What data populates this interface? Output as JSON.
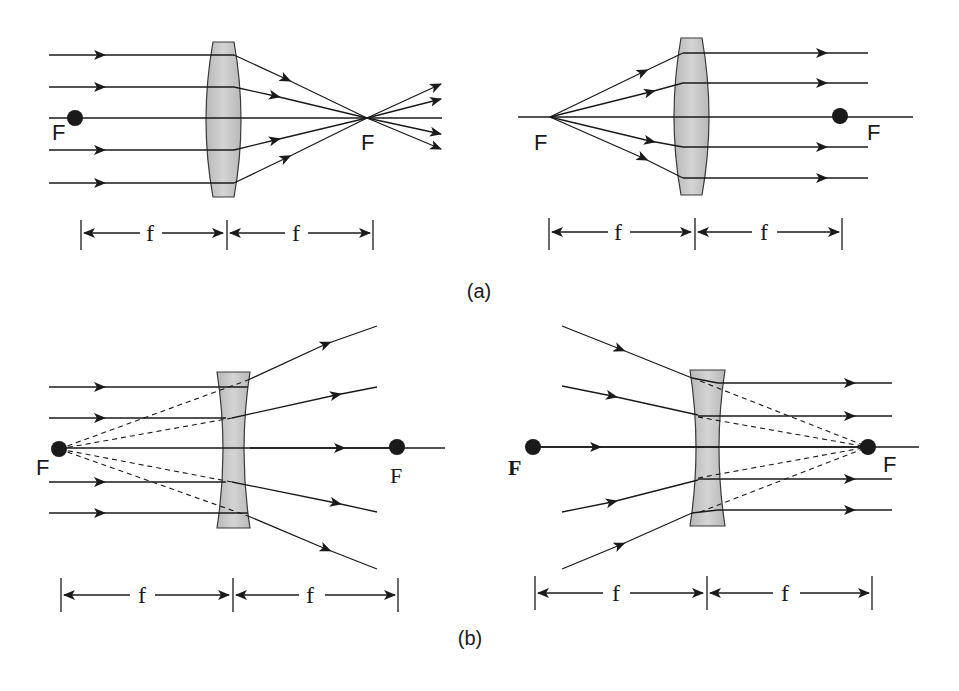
{
  "figure": {
    "colors": {
      "line": "#1a1a1a",
      "lens_fill": "#c4c4c4",
      "lens_stroke": "#3a3a3a",
      "focal_dot": "#1a1a1a"
    }
  },
  "panel_a": {
    "caption": "(a)",
    "left": {
      "lens_type": "convex",
      "focal_label_left": "F",
      "focal_label_right": "F",
      "dim_label_left": "f",
      "dim_label_right": "f"
    },
    "right": {
      "lens_type": "convex",
      "focal_label_left": "F",
      "focal_label_right": "F",
      "dim_label_left": "f",
      "dim_label_right": "f"
    }
  },
  "panel_b": {
    "caption": "(b)",
    "left": {
      "lens_type": "concave",
      "focal_label_left": "F",
      "focal_label_right": "F",
      "dim_label_left": "f",
      "dim_label_right": "f"
    },
    "right": {
      "lens_type": "concave",
      "focal_label_left": "F",
      "focal_label_right": "F",
      "dim_label_left": "f",
      "dim_label_right": "f"
    }
  }
}
